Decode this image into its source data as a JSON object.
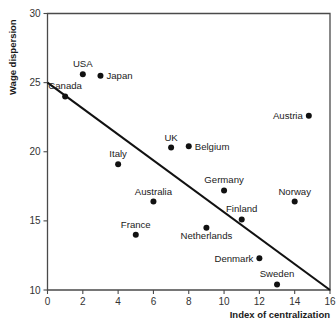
{
  "chart_data": {
    "type": "scatter",
    "title": "",
    "xlabel": "Index of centralization",
    "ylabel": "Wage dispersion",
    "xlim": [
      0,
      16
    ],
    "ylim": [
      10,
      30
    ],
    "xticks": [
      "0",
      "2",
      "4",
      "6",
      "8",
      "10",
      "12",
      "14",
      "16"
    ],
    "xtick_values": [
      0,
      2,
      4,
      6,
      8,
      10,
      12,
      14,
      16
    ],
    "yticks": [
      "10",
      "15",
      "20",
      "25",
      "30"
    ],
    "ytick_values": [
      10,
      15,
      20,
      25,
      30
    ],
    "grid": false,
    "legend": "none",
    "points": [
      {
        "label": "Canada",
        "x": 1,
        "y": 24.0,
        "label_pos": "above"
      },
      {
        "label": "USA",
        "x": 2,
        "y": 25.6,
        "label_pos": "above"
      },
      {
        "label": "Japan",
        "x": 3,
        "y": 25.5,
        "label_pos": "right"
      },
      {
        "label": "Italy",
        "x": 4,
        "y": 19.1,
        "label_pos": "above"
      },
      {
        "label": "France",
        "x": 5,
        "y": 14.0,
        "label_pos": "above"
      },
      {
        "label": "Australia",
        "x": 6,
        "y": 16.4,
        "label_pos": "above"
      },
      {
        "label": "UK",
        "x": 7,
        "y": 20.3,
        "label_pos": "above"
      },
      {
        "label": "Belgium",
        "x": 8,
        "y": 20.4,
        "label_pos": "right"
      },
      {
        "label": "Netherlands",
        "x": 9,
        "y": 14.5,
        "label_pos": "below"
      },
      {
        "label": "Germany",
        "x": 10,
        "y": 17.2,
        "label_pos": "above"
      },
      {
        "label": "Finland",
        "x": 11,
        "y": 15.1,
        "label_pos": "above"
      },
      {
        "label": "Denmark",
        "x": 12,
        "y": 12.3,
        "label_pos": "left"
      },
      {
        "label": "Sweden",
        "x": 13,
        "y": 10.4,
        "label_pos": "above"
      },
      {
        "label": "Norway",
        "x": 14,
        "y": 16.4,
        "label_pos": "above"
      },
      {
        "label": "Austria",
        "x": 14.8,
        "y": 22.6,
        "label_pos": "left"
      }
    ],
    "trendline": {
      "name": "fitted regression line",
      "x0": 0,
      "y0": 25,
      "x1": 16,
      "y1": 10
    },
    "colors": {
      "marker": "#111111",
      "line": "#111111",
      "axis": "#4a4a4a",
      "text": "#1a1a1a",
      "background": "#ffffff"
    }
  }
}
